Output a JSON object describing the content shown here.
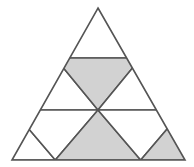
{
  "figure": {
    "background_color": "#ffffff",
    "stroke_color": "#555555",
    "shaded_fill": "#d2d2d2",
    "unshaded_fill": "#ffffff",
    "stroke_width": 1.6,
    "total_small_triangles": 9,
    "shaded_count": 4,
    "unshaded_count": 5,
    "shaded_fraction_label": "4/9",
    "outer_vertices": {
      "apex": [
        98,
        8
      ],
      "bottom_left": [
        12,
        160
      ],
      "bottom_right": [
        185,
        160
      ]
    },
    "row_divider_y": [
      58,
      110
    ],
    "rows": [
      {
        "index": 1,
        "label": "top-row",
        "cells": [
          {
            "id": "r1c1",
            "name": "top-apex-triangle",
            "orientation": "up",
            "shaded": false,
            "fill": "#ffffff",
            "points": "98,8 55.3,58 140.7,58"
          }
        ]
      },
      {
        "index": 2,
        "label": "middle-row",
        "cells": [
          {
            "id": "r2c1",
            "name": "middle-left-up-triangle",
            "orientation": "up",
            "shaded": false,
            "fill": "#ffffff",
            "points": "55.3,58 12.7,110 98,110"
          },
          {
            "id": "r2c2",
            "name": "middle-center-down-triangle",
            "orientation": "down",
            "shaded": true,
            "fill": "#d2d2d2",
            "points": "55.3,58 140.7,58 98,110"
          },
          {
            "id": "r2c3",
            "name": "middle-right-up-triangle",
            "orientation": "up",
            "shaded": false,
            "fill": "#ffffff",
            "points": "140.7,58 98,110 183.3,110"
          }
        ]
      },
      {
        "index": 3,
        "label": "bottom-row",
        "cells": [
          {
            "id": "r3c1",
            "name": "bottom-first-up-triangle",
            "orientation": "up",
            "shaded": false,
            "fill": "#ffffff",
            "points": "12.7,110 -13,160 55.3,160"
          },
          {
            "id": "r3c2",
            "name": "bottom-second-down-triangle",
            "orientation": "down",
            "shaded": false,
            "fill": "#ffffff",
            "points": "12.7,110 98,110 55.3,160"
          },
          {
            "id": "r3c3",
            "name": "bottom-center-up-triangle",
            "orientation": "up",
            "shaded": true,
            "fill": "#d2d2d2",
            "points": "98,110 55.3,160 140.7,160"
          },
          {
            "id": "r3c4",
            "name": "bottom-fourth-down-triangle",
            "orientation": "down",
            "shaded": false,
            "fill": "#ffffff",
            "points": "98,110 183.3,110 140.7,160"
          },
          {
            "id": "r3c5",
            "name": "bottom-last-up-triangle",
            "orientation": "up",
            "shaded": true,
            "fill": "#d2d2d2",
            "points": "183.3,110 140.7,160 226,160"
          }
        ]
      }
    ],
    "clip_outline_points": "98,8 185,160 12,160"
  }
}
